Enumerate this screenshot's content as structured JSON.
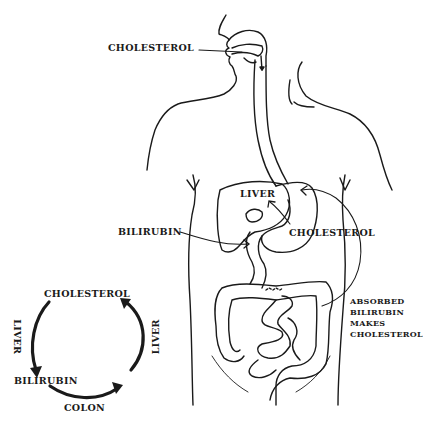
{
  "diagram": {
    "type": "anatomical-cycle-diagram",
    "colors": {
      "ink": "#1a1a1a",
      "background": "#ffffff"
    },
    "body_labels": {
      "mouth_cholesterol": "CHOLESTEROL",
      "liver": "LIVER",
      "bilirubin": "BILIRUBIN",
      "stomach_cholesterol": "CHOLESTEROL",
      "absorbed_line1": "ABSORBED",
      "absorbed_line2": "BILIRUBIN",
      "absorbed_line3": "MAKES",
      "absorbed_line4": "CHOLESTEROL"
    },
    "cycle": {
      "top": "CHOLESTEROL",
      "left_edge": "LIVER",
      "right_edge": "LIVER",
      "bottom_left": "BILIRUBIN",
      "bottom_edge": "COLON"
    }
  }
}
